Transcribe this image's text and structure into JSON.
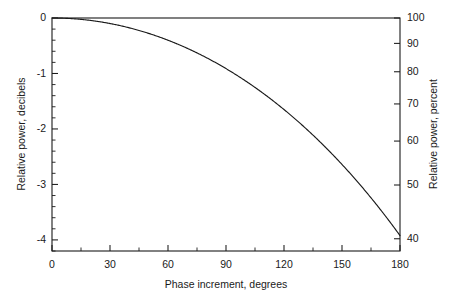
{
  "chart_data": {
    "type": "line",
    "title": "",
    "xlabel": "Phase increment, degrees",
    "ylabel": "Relative power, decibels",
    "y2label": "Relative power, percent",
    "xlim": [
      0,
      180
    ],
    "ylim": [
      -4.2,
      0
    ],
    "y2lim": [
      37.9,
      100
    ],
    "grid": false,
    "legend": null,
    "x_ticks": [
      0,
      30,
      60,
      90,
      120,
      150,
      180
    ],
    "x_tick_labels": [
      "0",
      "30",
      "60",
      "90",
      "120",
      "150",
      "180"
    ],
    "x_minor_step": 15,
    "y_ticks": [
      0,
      -1,
      -2,
      -3,
      -4
    ],
    "y_tick_labels": [
      "0",
      "-1",
      "-2",
      "-3",
      "-4"
    ],
    "y_minor_step": 0.2,
    "y2_ticks": [
      100,
      90,
      80,
      70,
      60,
      50,
      40
    ],
    "y2_tick_labels": [
      "100",
      "90",
      "80",
      "70",
      "60",
      "50",
      "40"
    ],
    "series": [
      {
        "name": "Relative power",
        "x": [
          0,
          10,
          20,
          30,
          40,
          50,
          60,
          70,
          80,
          90,
          100,
          110,
          120,
          130,
          140,
          150,
          160,
          170,
          180
        ],
        "y_db": [
          0.0,
          -0.011,
          -0.044,
          -0.1,
          -0.179,
          -0.281,
          -0.407,
          -0.558,
          -0.734,
          -0.937,
          -1.168,
          -1.429,
          -1.722,
          -2.05,
          -2.415,
          -2.822,
          -3.275,
          -3.779,
          -3.922
        ],
        "y_percent": [
          100.0,
          99.7,
          99.0,
          97.7,
          96.0,
          93.7,
          91.1,
          87.9,
          84.4,
          80.5,
          76.4,
          71.9,
          67.3,
          62.4,
          57.3,
          52.2,
          47.0,
          41.9,
          40.5
        ]
      }
    ]
  }
}
